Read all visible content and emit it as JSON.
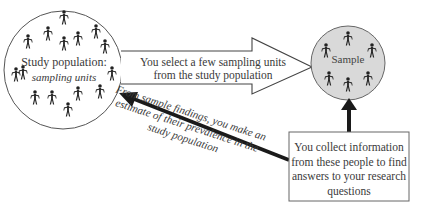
{
  "diagram": {
    "study_population": {
      "title": "Study population:",
      "subtitle": "sampling units",
      "icon": "person-icon",
      "figure_count": 15
    },
    "sample": {
      "title": "Sample",
      "icon": "person-icon",
      "figure_count": 6,
      "fill": "#d9d9d9"
    },
    "select_arrow": {
      "text": "You select a few sampling units from the study population"
    },
    "collect_box": {
      "text": "You collect information from these people to find answers to your research questions"
    },
    "estimate_arrow": {
      "text": "From sample findings, you make an estimate of their prevalence in the study population"
    },
    "colors": {
      "outline": "#555555",
      "arrow_dark": "#1a1a1a",
      "sample_fill": "#d9d9d9",
      "text": "#3a3a3a"
    }
  }
}
